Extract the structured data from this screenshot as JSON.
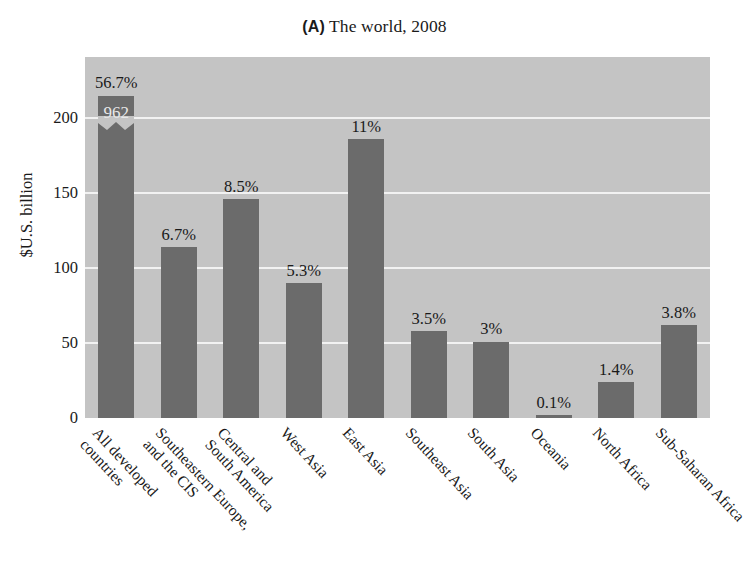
{
  "title": {
    "panel": "(A)",
    "text": "The world, 2008"
  },
  "axes": {
    "ylabel": "$U.S. billion",
    "yticks": [
      "0",
      "50",
      "100",
      "150",
      "200"
    ]
  },
  "chart_data": {
    "type": "bar",
    "title": "(A) The world, 2008",
    "xlabel": "",
    "ylabel": "$U.S. billion",
    "ylim": [
      0,
      241
    ],
    "yticks": [
      0,
      50,
      100,
      150,
      200
    ],
    "grid": true,
    "legend": null,
    "axis_break": {
      "bar_index": 0,
      "note": "First bar is truncated with a zig-zag break; its true value is 962"
    },
    "bar_color": "#6b6b6b",
    "plot_background": "#c4c4c4",
    "gridline_color": "#f2f2f2",
    "categories": [
      "All developed countries",
      "Southeastern Europe, and the CIS",
      "Central and South America",
      "West Asia",
      "East Asia",
      "Southeast Asia",
      "South Asia",
      "Oceania",
      "North Africa",
      "Sub-Saharan Africa"
    ],
    "category_lines": [
      [
        "All developed",
        "countries"
      ],
      [
        "Southeastern Europe,",
        "and the CIS"
      ],
      [
        "Central and",
        "South America"
      ],
      [
        "West Asia",
        ""
      ],
      [
        "East Asia",
        ""
      ],
      [
        "Southeast Asia",
        ""
      ],
      [
        "South Asia",
        ""
      ],
      [
        "Oceania",
        ""
      ],
      [
        "North Africa",
        ""
      ],
      [
        "Sub-Saharan Africa",
        ""
      ]
    ],
    "values": [
      962,
      114,
      146,
      90,
      186,
      58,
      51,
      2,
      24,
      62
    ],
    "drawn_values": [
      215,
      114,
      146,
      90,
      186,
      58,
      51,
      2,
      24,
      62
    ],
    "percent_labels": [
      "56.7%",
      "6.7%",
      "8.5%",
      "5.3%",
      "11%",
      "3.5%",
      "3%",
      "0.1%",
      "1.4%",
      "3.8%"
    ],
    "inner_labels": [
      "962",
      "",
      "",
      "",
      "",
      "",
      "",
      "",
      "",
      ""
    ]
  }
}
